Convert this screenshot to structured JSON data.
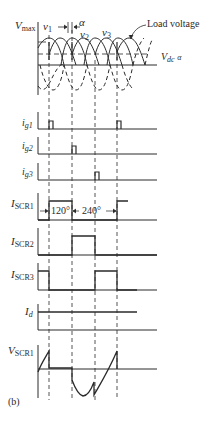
{
  "figure": {
    "panel_label": "(b)",
    "top_panel": {
      "vmax_label": "V",
      "vmax_sub": "max",
      "v1": "v",
      "v1_sub": "1",
      "v2": "v",
      "v2_sub": "2",
      "v3": "v",
      "v3_sub": "3",
      "alpha": "α",
      "load_voltage": "Load voltage",
      "vdc_label": "V",
      "vdc_sub": "dc",
      "vdc_alpha": "α"
    },
    "traces": [
      {
        "label": "i",
        "sub": "g1"
      },
      {
        "label": "i",
        "sub": "g2"
      },
      {
        "label": "i",
        "sub": "g3"
      },
      {
        "label": "I",
        "sub": "SCR1"
      },
      {
        "label": "I",
        "sub": "SCR2"
      },
      {
        "label": "I",
        "sub": "SCR3"
      },
      {
        "label": "I",
        "sub": "d"
      },
      {
        "label": "V",
        "sub": "SCR1"
      }
    ],
    "annotations": {
      "conduction_angle": "120°",
      "off_angle": "240°"
    },
    "colors": {
      "ink": "#2a2a2a",
      "background": "#ffffff"
    }
  }
}
